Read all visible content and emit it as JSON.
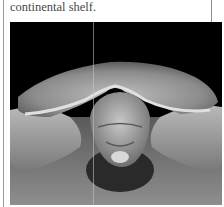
{
  "article": {
    "text_fragment": "continental shelf."
  },
  "figure": {
    "style": "black and white photograph",
    "colors": {
      "background_top": "#000000",
      "shell": "#9c9c9c",
      "sand": "#8a8a8a",
      "border": "#9a9a9a"
    }
  }
}
